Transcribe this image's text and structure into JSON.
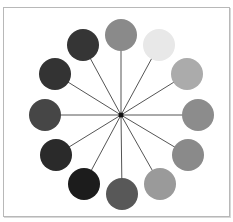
{
  "diagram": {
    "type": "radial-color-wheel",
    "center": {
      "x": 121,
      "y": 115
    },
    "spoke_color": "#555555",
    "hub_color": "#111111",
    "circle_radius": 16,
    "circles": [
      {
        "position": "12-oclock",
        "cx": 121,
        "cy": 35,
        "fill": "#8a8a8a"
      },
      {
        "position": "1-oclock",
        "cx": 159,
        "cy": 45,
        "fill": "#e8e8e8"
      },
      {
        "position": "2-oclock",
        "cx": 187,
        "cy": 74,
        "fill": "#ababab"
      },
      {
        "position": "3-oclock",
        "cx": 198,
        "cy": 115,
        "fill": "#8c8c8c"
      },
      {
        "position": "4-oclock",
        "cx": 188,
        "cy": 155,
        "fill": "#8a8a8a"
      },
      {
        "position": "5-oclock",
        "cx": 160,
        "cy": 184,
        "fill": "#9a9a9a"
      },
      {
        "position": "6-oclock",
        "cx": 122,
        "cy": 194,
        "fill": "#585858"
      },
      {
        "position": "7-oclock",
        "cx": 84,
        "cy": 184,
        "fill": "#1c1c1c"
      },
      {
        "position": "8-oclock",
        "cx": 56,
        "cy": 155,
        "fill": "#2a2a2a"
      },
      {
        "position": "9-oclock",
        "cx": 45,
        "cy": 115,
        "fill": "#464646"
      },
      {
        "position": "10-oclock",
        "cx": 55,
        "cy": 74,
        "fill": "#333333"
      },
      {
        "position": "11-oclock",
        "cx": 83,
        "cy": 45,
        "fill": "#353535"
      }
    ]
  }
}
